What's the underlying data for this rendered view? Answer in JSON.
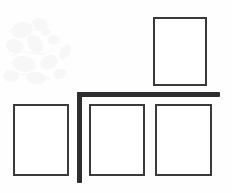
{
  "figure": {
    "background_color": "#fefefe",
    "width": 232,
    "height": 193
  },
  "style": {
    "panel_stroke_color": "#3a3a3c",
    "panel_fill_color": "#ffffff",
    "panel_stroke_width": 2,
    "bar_color": "#2e2e30",
    "bar_thickness": 5,
    "watermark_color": "#f4f4f4"
  },
  "panels": [
    {
      "id": "panel-top-right",
      "label": "",
      "x": 153,
      "y": 17,
      "width": 54,
      "height": 69
    },
    {
      "id": "panel-bottom-left",
      "label": "",
      "x": 13,
      "y": 104,
      "width": 56,
      "height": 72
    },
    {
      "id": "panel-bottom-middle",
      "label": "",
      "x": 89,
      "y": 104,
      "width": 56,
      "height": 72
    },
    {
      "id": "panel-bottom-right",
      "label": "",
      "x": 155,
      "y": 104,
      "width": 57,
      "height": 72
    }
  ],
  "divider": {
    "shape": "L",
    "vertical": {
      "x": 77,
      "y": 92,
      "width": 5,
      "height": 91
    },
    "horizontal": {
      "x": 77,
      "y": 92,
      "width": 143,
      "height": 5
    }
  },
  "watermark": {
    "present": true,
    "region": "upper-left",
    "description": "faint mottled paper texture"
  }
}
